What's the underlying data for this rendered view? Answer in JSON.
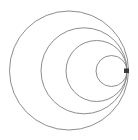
{
  "figure": {
    "background_color": "#ffffff",
    "stroke_color": "#808080",
    "stroke_width": 0.9,
    "marker_color": "#3a3a3a",
    "canvas": {
      "width": 138,
      "height": 140
    }
  },
  "chart_data": {
    "type": "scatter",
    "subtitle": "",
    "xlabel": "",
    "ylabel": "",
    "xlim": [
      0,
      138
    ],
    "ylim": [
      0,
      140
    ],
    "grid": false,
    "legend": "none",
    "tangency_point": {
      "x": 127,
      "y": 71
    },
    "series": [
      {
        "name": "circle-1",
        "label": "outermost circle",
        "cx": 69.0,
        "cy": 70.5,
        "r": 59.5,
        "left_edge_x": 11,
        "right_edge_x": 127,
        "top_edge_y": 11,
        "bottom_edge_y": 130,
        "diameter": 119
      },
      {
        "name": "circle-2",
        "label": "second circle",
        "cx": 84.0,
        "cy": 70.8,
        "r": 43.0,
        "left_edge_x": 41,
        "right_edge_x": 127,
        "top_edge_y": 30,
        "bottom_edge_y": 112,
        "diameter": 86
      },
      {
        "name": "circle-3",
        "label": "third circle",
        "cx": 96.5,
        "cy": 71.0,
        "r": 30.5,
        "left_edge_x": 66,
        "right_edge_x": 127,
        "top_edge_y": 45,
        "bottom_edge_y": 101,
        "diameter": 61
      },
      {
        "name": "circle-4",
        "label": "innermost circle",
        "cx": 111.5,
        "cy": 71.0,
        "r": 15.5,
        "left_edge_x": 96,
        "right_edge_x": 127,
        "top_edge_y": 56,
        "bottom_edge_y": 87,
        "diameter": 31
      }
    ],
    "marker": {
      "name": "tangency-marker",
      "shape": "rectangle",
      "x": 124,
      "y": 68.5,
      "width": 5,
      "height": 4.5,
      "color": "#3a3a3a"
    }
  }
}
